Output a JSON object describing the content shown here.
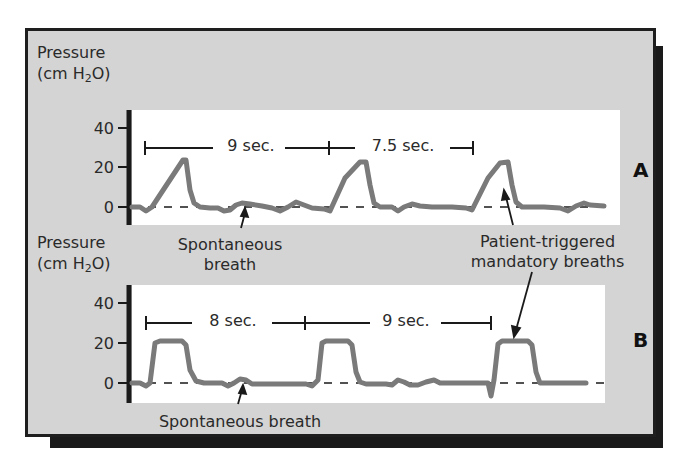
{
  "figure": {
    "y_axis_label_line1": "Pressure",
    "y_axis_label_line2_prefix": "(cm H",
    "y_axis_label_sub": "2",
    "y_axis_label_line2_suffix": "O)",
    "y_ticks": [
      "40",
      "20",
      "0"
    ],
    "waveform_color": "#7a7a7a",
    "background_color": "#d4d4d4"
  },
  "panel_a": {
    "label": "A",
    "interval_1": "9 sec.",
    "interval_2": "7.5 sec.",
    "annotation_spontaneous_line1": "Spontaneous",
    "annotation_spontaneous_line2": "breath"
  },
  "panel_b": {
    "label": "B",
    "interval_1": "8 sec.",
    "interval_2": "9 sec.",
    "annotation_spontaneous": "Spontaneous breath"
  },
  "shared_annotation": {
    "line1": "Patient-triggered",
    "line2": "mandatory breaths"
  }
}
